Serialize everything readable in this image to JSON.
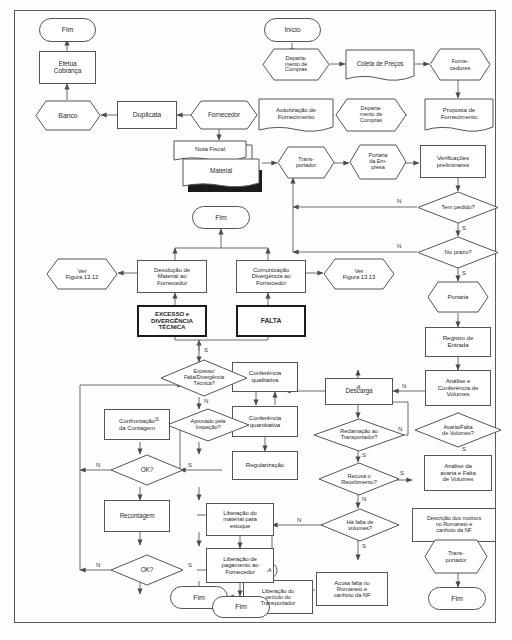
{
  "figure": {
    "branch_labels": {
      "yes": "S",
      "no": "N"
    },
    "connector_label": "A"
  },
  "nodes": {
    "fim_top_left": {
      "label": "Fim",
      "shape": "terminator"
    },
    "efetua_cobranca": {
      "label": "Efetua\nCobrança",
      "shape": "process"
    },
    "banco": {
      "label": "Banco",
      "shape": "entity"
    },
    "duplicata": {
      "label": "Duplicata",
      "shape": "process"
    },
    "fornecedor_mid": {
      "label": "Fornecedor",
      "shape": "entity"
    },
    "inicio": {
      "label": "Início",
      "shape": "terminator"
    },
    "depto_compras_1": {
      "label": "Departa-\nmento de\nCompras",
      "shape": "entity"
    },
    "coleta_precos": {
      "label": "Coleta de Preços",
      "shape": "document"
    },
    "fornecedores": {
      "label": "Forne-\ncedores",
      "shape": "entity"
    },
    "proposta_forn": {
      "label": "Proposta de\nFornecimento",
      "shape": "document"
    },
    "depto_compras_2": {
      "label": "Departa-\nmento de\nCompras",
      "shape": "entity"
    },
    "autorizacao_forn": {
      "label": "Autorização de\nFornecimento",
      "shape": "document"
    },
    "nota_fiscal": {
      "label": "Nota Fiscal",
      "shape": "document-stack"
    },
    "material": {
      "label": "Material",
      "shape": "document-stack"
    },
    "transportador_top": {
      "label": "Trans-\nportador",
      "shape": "entity"
    },
    "portaria_empresa": {
      "label": "Portaria\nda Em-\npresa",
      "shape": "entity"
    },
    "verificacoes": {
      "label": "Verificações\npreliminares",
      "shape": "process"
    },
    "tem_pedido": {
      "label": "Tem pedido?",
      "shape": "decision"
    },
    "no_prazo": {
      "label": "No prazo?",
      "shape": "decision"
    },
    "portaria": {
      "label": "Portaria",
      "shape": "entity"
    },
    "registro_entrada": {
      "label": "Registro de\nEntrada",
      "shape": "process"
    },
    "analise_conf_vol": {
      "label": "Análise e\nConferência de\nVolumes",
      "shape": "process"
    },
    "avaria_falta_vol": {
      "label": "Avaria/Falta\nde Volumes?",
      "shape": "decision"
    },
    "analise_avaria": {
      "label": "Análise da\navaria e Falta\nde Volumes",
      "shape": "process"
    },
    "descricao_motivos": {
      "label": "Descrição dos motivos\nno Romaneio e\ncanhoto da NF",
      "shape": "process"
    },
    "transportador_rt": {
      "label": "Trans-\nportador",
      "shape": "entity"
    },
    "fim_bottom_right": {
      "label": "Fim",
      "shape": "terminator"
    },
    "descarga": {
      "label": "Descarga",
      "shape": "process"
    },
    "reclamacao_transp": {
      "label": "Reclamação ao\nTransportador?",
      "shape": "decision"
    },
    "recusa_recebimento": {
      "label": "Recusa o\nRecebimento?",
      "shape": "decision"
    },
    "ha_falta_volumes": {
      "label": "Há falta de\nvolumes?",
      "shape": "decision"
    },
    "acusa_falta": {
      "label": "Acusa falta no\nRomaneio e\ncanhoto da NF",
      "shape": "process"
    },
    "liberacao_veiculo": {
      "label": "Liberação do\nveículo do\nTransportador",
      "shape": "process"
    },
    "fim_bottom_center": {
      "label": "Fim",
      "shape": "terminator"
    },
    "conf_qualitativa": {
      "label": "Conferência\nqualitativa",
      "shape": "process"
    },
    "conf_quantitativa": {
      "label": "Conferência\nquantitativa",
      "shape": "process"
    },
    "regularizacao": {
      "label": "Regularização",
      "shape": "process"
    },
    "excesso_falta_div": {
      "label": "Excesso/\nFalta/Divergência\nTécnica?",
      "shape": "decision"
    },
    "aprovado_inspecao": {
      "label": "Aprovado pela\nInspeção?",
      "shape": "decision"
    },
    "confrontacao": {
      "label": "Confrontação\nda Contagem",
      "shape": "process"
    },
    "ok_1": {
      "label": "OK?",
      "shape": "decision"
    },
    "recontagem": {
      "label": "Recontagem",
      "shape": "process"
    },
    "ok_2": {
      "label": "OK?",
      "shape": "decision"
    },
    "liberacao_material": {
      "label": "Liberação do\nmaterial para\nestoque",
      "shape": "process"
    },
    "liberacao_pagamento": {
      "label": "Liberação de\npagamento ao\nFornecedor",
      "shape": "process"
    },
    "fim_bottom_ml": {
      "label": "Fim",
      "shape": "terminator"
    },
    "devolucao_material": {
      "label": "Devolução de\nMaterial ao\nFornecedor",
      "shape": "process"
    },
    "comunicacao_div": {
      "label": "Comunicação\nDivergência ao\nFornecedor",
      "shape": "process"
    },
    "excesso_divergencia": {
      "label": "EXCESSO e\nDIVERGÊNCIA\nTÉCNICA",
      "shape": "process-bold"
    },
    "falta": {
      "label": "FALTA",
      "shape": "process-bold"
    },
    "ver_figura_1312": {
      "label": "Ver\nFigura 13.12",
      "shape": "entity"
    },
    "ver_figura_1313": {
      "label": "Ver\nFigura 13.13",
      "shape": "entity"
    },
    "fim_mid": {
      "label": "Fim",
      "shape": "terminator"
    },
    "conector_a_1": {
      "label": "A",
      "shape": "connector"
    },
    "conector_a_2": {
      "label": "A",
      "shape": "connector"
    }
  },
  "branches": {
    "tem_pedido_no": "N",
    "tem_pedido_yes": "S",
    "no_prazo_no": "N",
    "no_prazo_yes": "S",
    "avaria_no": "N",
    "avaria_yes": "S",
    "reclamacao_no": "N",
    "reclamacao_yes": "S",
    "recusa_no": "N",
    "recusa_yes": "S",
    "falta_vol_no": "N",
    "falta_vol_yes": "S",
    "excesso_yes": "S",
    "excesso_no": "N",
    "aprovado_yes": "S",
    "ok1_no": "N",
    "ok1_yes": "S",
    "ok2_no": "N",
    "ok2_yes": "S"
  },
  "colors": {
    "stroke": "#555555",
    "text": "#2b2b2b",
    "bold_stroke": "#1c1c1c",
    "frame": "#5a5a5a",
    "background": "#fdfdfc",
    "shadow": "#1b1b1b"
  }
}
